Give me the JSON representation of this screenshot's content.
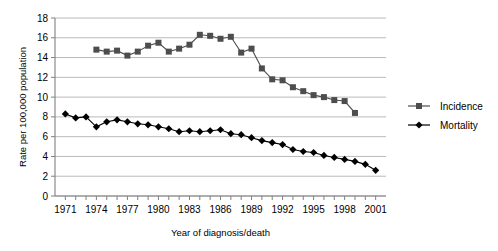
{
  "chart_data": {
    "type": "line",
    "title": "",
    "xlabel": "Year of diagnosis/death",
    "ylabel": "Rate per 100,000 population",
    "xlim": [
      1970,
      2002
    ],
    "ylim": [
      0,
      18
    ],
    "ytick_step": 2,
    "xtick_step": 3,
    "grid": true,
    "legend_position": "right",
    "yticks": [
      "0",
      "2",
      "4",
      "6",
      "8",
      "10",
      "12",
      "14",
      "16",
      "18"
    ],
    "xticks": [
      "1971",
      "1974",
      "1977",
      "1980",
      "1983",
      "1986",
      "1989",
      "1992",
      "1995",
      "1998",
      "2001"
    ],
    "series": [
      {
        "name": "Incidence",
        "marker": "square",
        "color": "#4d4d4d",
        "x": [
          1974,
          1975,
          1976,
          1977,
          1978,
          1979,
          1980,
          1981,
          1982,
          1983,
          1984,
          1985,
          1986,
          1987,
          1988,
          1989,
          1990,
          1991,
          1992,
          1993,
          1994,
          1995,
          1996,
          1997,
          1998,
          1999
        ],
        "values": [
          14.8,
          14.6,
          14.7,
          14.2,
          14.6,
          15.2,
          15.5,
          14.6,
          14.9,
          15.3,
          16.3,
          16.2,
          15.9,
          16.1,
          14.5,
          14.9,
          12.9,
          11.8,
          11.7,
          11.0,
          10.6,
          10.2,
          10.0,
          9.7,
          9.6,
          8.4
        ]
      },
      {
        "name": "Mortality",
        "marker": "diamond",
        "color": "#000000",
        "x": [
          1971,
          1972,
          1973,
          1974,
          1975,
          1976,
          1977,
          1978,
          1979,
          1980,
          1981,
          1982,
          1983,
          1984,
          1985,
          1986,
          1987,
          1988,
          1989,
          1990,
          1991,
          1992,
          1993,
          1994,
          1995,
          1996,
          1997,
          1998,
          1999,
          2000,
          2001
        ],
        "values": [
          8.3,
          7.9,
          8.0,
          7.0,
          7.5,
          7.7,
          7.5,
          7.3,
          7.2,
          7.0,
          6.8,
          6.5,
          6.6,
          6.5,
          6.6,
          6.7,
          6.3,
          6.2,
          5.9,
          5.6,
          5.4,
          5.2,
          4.7,
          4.5,
          4.4,
          4.1,
          3.9,
          3.7,
          3.5,
          3.2,
          2.6
        ]
      }
    ]
  },
  "legend": {
    "items": [
      {
        "label": "Incidence"
      },
      {
        "label": "Mortality"
      }
    ]
  }
}
